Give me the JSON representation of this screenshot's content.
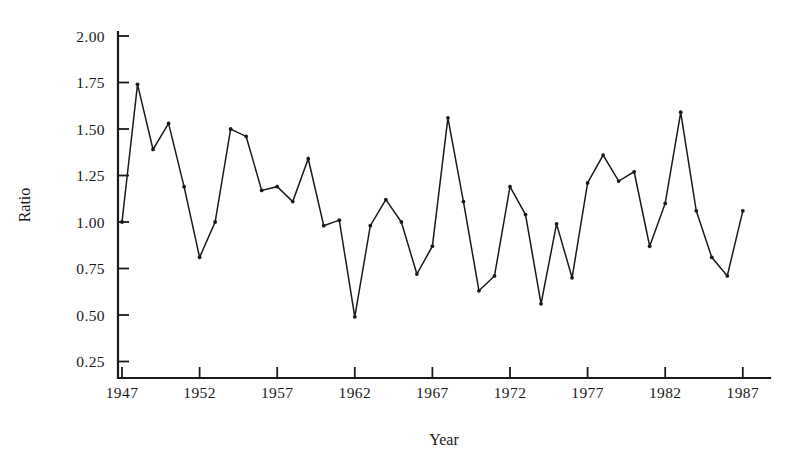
{
  "chart_data": {
    "type": "line",
    "title": "",
    "xlabel": "Year",
    "ylabel": "Ratio",
    "xlim": [
      1947,
      1987
    ],
    "ylim": [
      0.125,
      2.125
    ],
    "grid": false,
    "legend": null,
    "marker": "dot",
    "line_color": "#1a1a1a",
    "xticks": [
      1947,
      1952,
      1957,
      1962,
      1967,
      1972,
      1977,
      1982,
      1987
    ],
    "xtick_labels": [
      "1947",
      "1952",
      "1957",
      "1962",
      "1967",
      "1972",
      "1977",
      "1982",
      "1987"
    ],
    "yticks": [
      0.25,
      0.5,
      0.75,
      1.0,
      1.25,
      1.5,
      1.75,
      2.0
    ],
    "ytick_labels": [
      "0.25",
      "0.50",
      "0.75",
      "1.00",
      "1.25",
      "1.50",
      "1.75",
      "2.00"
    ],
    "x": [
      1947,
      1948,
      1949,
      1950,
      1951,
      1952,
      1953,
      1954,
      1955,
      1956,
      1957,
      1958,
      1959,
      1960,
      1961,
      1962,
      1963,
      1964,
      1965,
      1966,
      1967,
      1968,
      1969,
      1970,
      1971,
      1972,
      1973,
      1974,
      1975,
      1976,
      1977,
      1978,
      1979,
      1980,
      1981,
      1982,
      1983,
      1984,
      1985,
      1986,
      1987
    ],
    "values": [
      1.0,
      1.74,
      1.39,
      1.53,
      1.19,
      0.81,
      1.0,
      1.5,
      1.46,
      1.17,
      1.19,
      1.11,
      1.34,
      0.98,
      1.01,
      0.49,
      0.98,
      1.12,
      1.0,
      0.72,
      0.87,
      1.56,
      1.11,
      0.63,
      0.71,
      1.19,
      1.04,
      0.56,
      0.99,
      0.7,
      1.21,
      1.36,
      1.22,
      1.27,
      0.87,
      1.1,
      1.59,
      1.06,
      0.81,
      0.71,
      1.06
    ]
  },
  "geometry": {
    "plot_left": 118,
    "plot_right": 770,
    "plot_bottom": 378,
    "axis_top": 32,
    "x_origin": 122,
    "x_per_year": 15.52,
    "y_at_one": 222,
    "y_per_unit": 186.0
  }
}
